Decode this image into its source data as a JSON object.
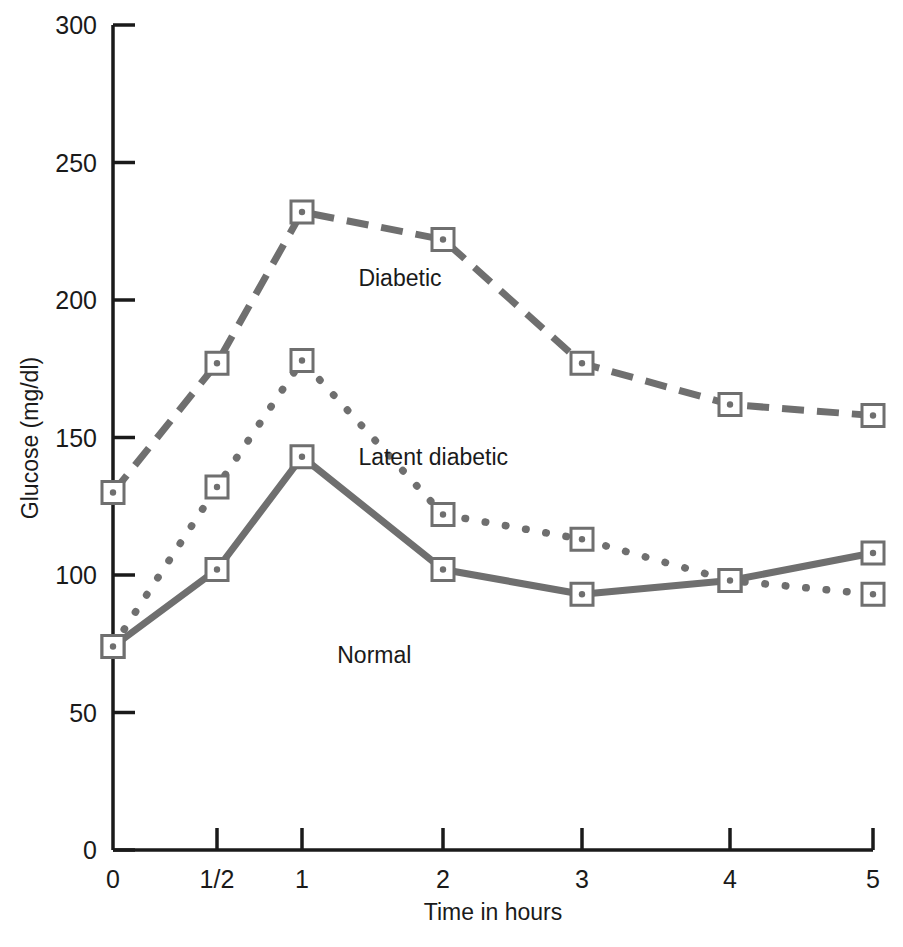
{
  "chart_data": {
    "type": "line",
    "title": "",
    "xlabel": "Time in hours",
    "ylabel": "Glucose (mg/dl)",
    "x_tick_labels": [
      "0",
      "1/2",
      "1",
      "2",
      "3",
      "4",
      "5"
    ],
    "x_tick_values": [
      0,
      0.5,
      1,
      2,
      3,
      4,
      5
    ],
    "y_tick_labels": [
      "0",
      "50",
      "100",
      "150",
      "200",
      "250",
      "300"
    ],
    "y_tick_values": [
      0,
      50,
      100,
      150,
      200,
      250,
      300
    ],
    "ylim": [
      0,
      300
    ],
    "grid": false,
    "legend_position": "inline-annotations",
    "series": [
      {
        "name": "Diabetic",
        "line_style": "dashed",
        "color": "#6f6f6f",
        "marker": "open-square-dot",
        "values": [
          130,
          177,
          232,
          222,
          177,
          162,
          158
        ],
        "annotation": "Diabetic",
        "annotation_x": 2.4,
        "annotation_y": 205
      },
      {
        "name": "Latent diabetic",
        "line_style": "dotted",
        "color": "#6f6f6f",
        "marker": "open-square-dot",
        "values": [
          74,
          132,
          178,
          122,
          113,
          98,
          93
        ],
        "annotation": "Latent diabetic",
        "annotation_x": 2.4,
        "annotation_y": 140
      },
      {
        "name": "Normal",
        "line_style": "solid",
        "color": "#6f6f6f",
        "marker": "open-square-dot",
        "values": [
          74,
          102,
          143,
          102,
          93,
          98,
          108
        ],
        "annotation": "Normal",
        "annotation_x": 2.25,
        "annotation_y": 68
      }
    ]
  },
  "colors": {
    "axis": "#1a1a1a",
    "series_line": "#6f6f6f",
    "marker_stroke": "#6f6f6f",
    "background": "#ffffff"
  }
}
